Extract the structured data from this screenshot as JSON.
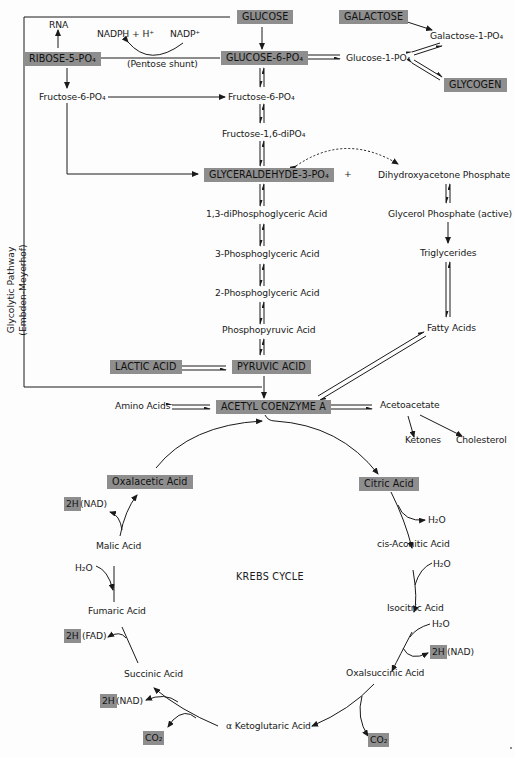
{
  "diagram": {
    "title": "KREBS CYCLE",
    "side_label": {
      "line1": "Glycolytic Pathway",
      "line2": "(Embden-Meyerhof)"
    },
    "colors": {
      "box_fill": "#8e8e8e",
      "line": "#1a1a1a",
      "background": "#fdfdfd"
    },
    "highlighted_nodes": {
      "glucose": "GLUCOSE",
      "galactose": "GALACTOSE",
      "ribose5p": "RIBOSE-5-PO₄",
      "glucose6p": "GLUCOSE-6-PO₄",
      "glycogen": "GLYCOGEN",
      "g3p": "GLYCERALDEHYDE-3-PO₄",
      "lactic": "LACTIC ACID",
      "pyruvic": "PYRUVIC ACID",
      "acetylcoa": "ACETYL COENZYME A",
      "oxalacetic": "Oxalacetic Acid",
      "citric": "Citric Acid"
    },
    "nodes": {
      "rna": "RNA",
      "nadph": "NADPH + H⁺",
      "nadp": "NADP⁺",
      "pentose_shunt": "(Pentose shunt)",
      "galactose1p": "Galactose-1-PO₄",
      "glucose1p": "Glucose-1-PO₄",
      "fructose6p_left": "Fructose-6-PO₄",
      "fructose6p": "Fructose-6-PO₄",
      "fructose16dip": "Fructose-1,6-diPO₄",
      "plus": "+",
      "dhap": "Dihydroxyacetone Phosphate",
      "glycerol_p": "Glycerol Phosphate (active)",
      "triglycerides": "Triglycerides",
      "fatty_acids": "Fatty Acids",
      "bpg13": "1,3-diPhosphoglyceric Acid",
      "pg3": "3-Phosphoglyceric Acid",
      "pg2": "2-Phosphoglyceric Acid",
      "pep": "Phosphopyruvic Acid",
      "amino_acids": "Amino Acids",
      "acetoacetate": "Acetoacetate",
      "ketones": "Ketones",
      "cholesterol": "Cholesterol"
    },
    "krebs": {
      "malic": "Malic Acid",
      "fumaric": "Fumaric Acid",
      "succinic": "Succinic Acid",
      "aketo": "α Ketoglutaric Acid",
      "oxalsuccinic": "Oxalsuccinic Acid",
      "isocitric": "Isocitric Acid",
      "cisaconitic": "cis-Aconitic Acid",
      "h2o_citric": "H₂O",
      "h2o_aconitic": "H₂O",
      "h2o_isocitric": "H₂O",
      "h2o_malic": "H₂O",
      "twoH": "2H",
      "nad": "(NAD)",
      "fad": "(FAD)",
      "co2": "CO₂"
    }
  }
}
